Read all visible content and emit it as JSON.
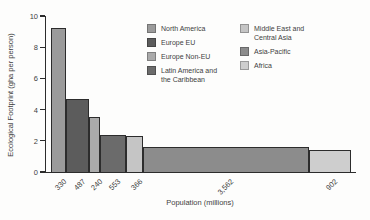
{
  "chart_data": {
    "type": "bar",
    "variant": "variable-width-bar (bar width proportional to population)",
    "title": "",
    "xlabel": "Population (millions)",
    "ylabel": "Ecological Footprint (gha per person)",
    "ylim": [
      0,
      10
    ],
    "yticks": [
      0,
      2,
      4,
      6,
      8,
      10
    ],
    "grid": false,
    "legend_position": "top-right, two columns",
    "x_tick_label_rotation_deg": 45,
    "regions": [
      {
        "name": "North America",
        "x_label": "330",
        "population_millions": 330,
        "footprint_gha_per_person": 9.2,
        "color": "#9b9b9b"
      },
      {
        "name": "Europe EU",
        "x_label": "487",
        "population_millions": 487,
        "footprint_gha_per_person": 4.7,
        "color": "#5c5c5c"
      },
      {
        "name": "Europe Non-EU",
        "x_label": "240",
        "population_millions": 240,
        "footprint_gha_per_person": 3.5,
        "color": "#aaaaaa"
      },
      {
        "name": "Latin America and the Caribbean",
        "x_label": "553",
        "population_millions": 553,
        "footprint_gha_per_person": 2.4,
        "color": "#6b6b6b"
      },
      {
        "name": "Middle East and Central Asia",
        "x_label": "366",
        "population_millions": 366,
        "footprint_gha_per_person": 2.3,
        "color": "#c5c5c5"
      },
      {
        "name": "Asia-Pacific",
        "x_label": "3,562",
        "population_millions": 3562,
        "footprint_gha_per_person": 1.6,
        "color": "#8c8c8c"
      },
      {
        "name": "Africa",
        "x_label": "902",
        "population_millions": 902,
        "footprint_gha_per_person": 1.4,
        "color": "#cecece"
      }
    ]
  },
  "legend": {
    "columns": [
      {
        "items": [
          {
            "label": "North America",
            "color": "#9b9b9b"
          },
          {
            "label": "Europe EU",
            "color": "#5c5c5c"
          },
          {
            "label": "Europe Non-EU",
            "color": "#aaaaaa"
          },
          {
            "label": "Latin America and\nthe Caribbean",
            "color": "#6b6b6b"
          }
        ]
      },
      {
        "items": [
          {
            "label": "Middle East and\nCentral Asia",
            "color": "#c5c5c5"
          },
          {
            "label": "Asia-Pacific",
            "color": "#8c8c8c"
          },
          {
            "label": "Africa",
            "color": "#cecece"
          }
        ]
      }
    ]
  },
  "colors": {
    "axis": "#2c2c2c",
    "text": "#3e3e3e",
    "background": "#fdfdfc"
  }
}
